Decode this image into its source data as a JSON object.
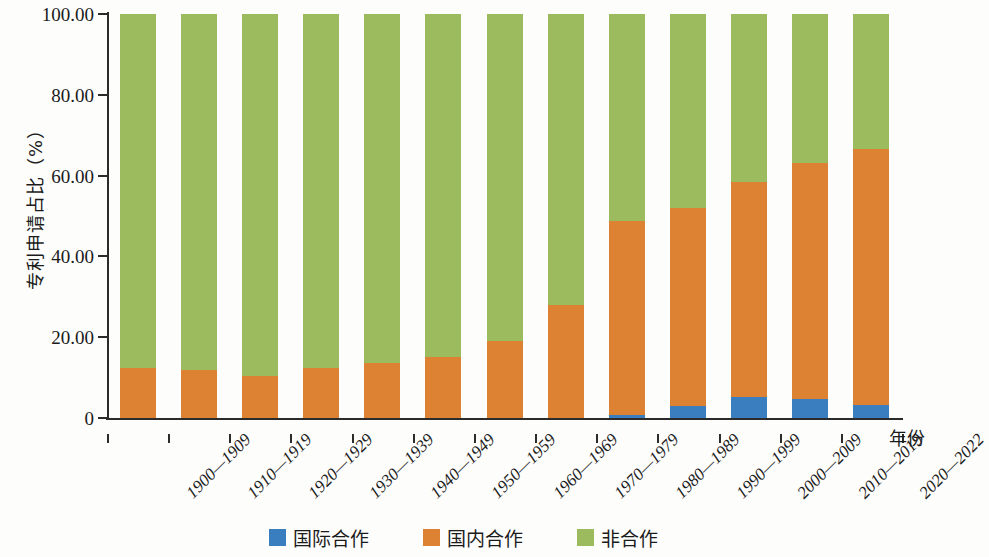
{
  "chart_data": {
    "type": "bar",
    "subtype": "stacked-percentage",
    "title": "",
    "xlabel": "年份",
    "ylabel": "专利申请占比（%）",
    "ylim": [
      0,
      100
    ],
    "yticks": [
      "0",
      "20.00",
      "40.00",
      "60.00",
      "80.00",
      "100.00"
    ],
    "ytick_values": [
      0,
      20,
      40,
      60,
      80,
      100
    ],
    "grid": false,
    "legend_position": "bottom-center",
    "categories": [
      "1900—1909",
      "1910—1919",
      "1920—1929",
      "1930—1939",
      "1940—1949",
      "1950—1959",
      "1960—1969",
      "1970—1979",
      "1980—1989",
      "1990—1999",
      "2000—2009",
      "2010—2019",
      "2020—2022"
    ],
    "series": [
      {
        "name": "国际合作",
        "color": "#3a7ebf",
        "values": [
          0.0,
          0.0,
          0.0,
          0.0,
          0.0,
          0.0,
          0.0,
          0.0,
          0.8,
          3.0,
          5.3,
          4.7,
          3.2
        ]
      },
      {
        "name": "国内合作",
        "color": "#dd8133",
        "values": [
          12.4,
          11.9,
          10.4,
          12.5,
          13.5,
          15.1,
          19.0,
          28.0,
          48.0,
          49.0,
          53.0,
          58.5,
          63.5
        ]
      },
      {
        "name": "非合作",
        "color": "#9cbb5e",
        "values": [
          87.6,
          88.1,
          89.6,
          87.5,
          86.5,
          84.9,
          81.0,
          72.0,
          51.2,
          48.0,
          41.7,
          36.8,
          33.3
        ]
      }
    ],
    "cumulative_tops": {
      "国际合作": [
        0.0,
        0.0,
        0.0,
        0.0,
        0.0,
        0.0,
        0.0,
        0.0,
        0.8,
        3.0,
        5.3,
        4.7,
        3.2
      ],
      "国内合作": [
        12.4,
        11.9,
        10.4,
        12.5,
        13.5,
        15.1,
        19.0,
        28.0,
        48.8,
        52.0,
        58.3,
        63.2,
        66.7
      ],
      "非合作": [
        100,
        100,
        100,
        100,
        100,
        100,
        100,
        100,
        100,
        100,
        100,
        100,
        100
      ]
    }
  },
  "legend": {
    "items": [
      {
        "label": "国际合作",
        "color": "#3a7ebf"
      },
      {
        "label": "国内合作",
        "color": "#dd8133"
      },
      {
        "label": "非合作",
        "color": "#9cbb5e"
      }
    ]
  },
  "axes": {
    "y_title": "专利申请占比（%）",
    "x_title": "年份"
  }
}
